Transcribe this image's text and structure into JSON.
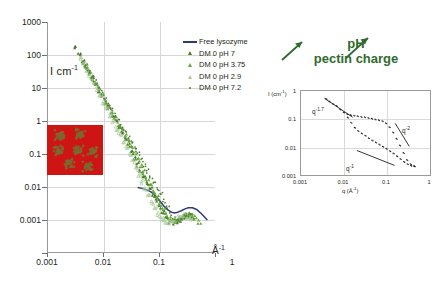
{
  "main": {
    "ylabel": "I cm",
    "ylabel_exp": "-1",
    "xlabel": "Å",
    "xlabel_exp": "-1",
    "yticks": [
      "1000",
      "100",
      "10",
      "1",
      "0.1",
      "0.01",
      "0.001"
    ],
    "xticks": [
      "0.001",
      "0.01",
      "0.1",
      "1"
    ]
  },
  "legend": {
    "items": [
      {
        "label": "Free lysozyme",
        "key": "line",
        "color": "#2b3b7a"
      },
      {
        "label": "DM 0  pH 7",
        "key": "triangle-dark",
        "color": "#4a7a2b"
      },
      {
        "label": "DM 0  pH 3.75",
        "key": "triangle-mid",
        "color": "#63a83a"
      },
      {
        "label": "DM 0  pH 2.9",
        "key": "triangle-open",
        "color": "#a9c89a"
      },
      {
        "label": "DM 0  pH 7.2",
        "key": "dot",
        "color": "#4d7d32"
      }
    ]
  },
  "annotation": {
    "line1": "pH",
    "line2": "pectin charge",
    "color": "#2f6b2f",
    "arrow_left": "arrow-up-right",
    "arrow_right": "arrow-up-right"
  },
  "tem_inset": {
    "background_color": "#cf1414",
    "particle_color": "#7a6a2e",
    "particle_count": 7
  },
  "inset": {
    "ylabel": "I (cm",
    "ylabel_exp": "-1",
    "ylabel_tail": ")",
    "xlabel": "q (Å",
    "xlabel_exp": "-1",
    "xlabel_tail": ")",
    "yticks": [
      "1",
      "0.1",
      "0.01",
      "0.001"
    ],
    "xticks": [
      "0.001",
      "0.01",
      "0.1",
      "1"
    ],
    "power_labels": [
      {
        "base": "q",
        "exp": "-1",
        "text": "q-1"
      },
      {
        "base": "q",
        "exp": "-2",
        "text": "q-2"
      },
      {
        "base": "q",
        "exp": "-1.7",
        "text": "q-1.7"
      }
    ]
  },
  "chart_data": {
    "type": "scatter",
    "title": "",
    "xlabel": "Å^-1",
    "ylabel": "I cm^-1",
    "xscale": "log",
    "yscale": "log",
    "xlim": [
      0.001,
      1
    ],
    "ylim": [
      0.001,
      1000
    ],
    "grid": true,
    "legend_position": "upper-right-inside",
    "series": [
      {
        "name": "Free lysozyme",
        "type": "line",
        "color": "#2b3b7a",
        "x": [
          0.04,
          0.05,
          0.06,
          0.07,
          0.08,
          0.09,
          0.1,
          0.12,
          0.14,
          0.16,
          0.18,
          0.2,
          0.24,
          0.28,
          0.32,
          0.38,
          0.45,
          0.55,
          0.7
        ],
        "y": [
          0.05,
          0.047,
          0.043,
          0.038,
          0.032,
          0.027,
          0.022,
          0.016,
          0.013,
          0.0115,
          0.011,
          0.0112,
          0.0125,
          0.014,
          0.015,
          0.015,
          0.0135,
          0.0105,
          0.0072
        ]
      },
      {
        "name": "DM 0  pH 7",
        "type": "scatter",
        "marker": "triangle",
        "color": "#4a7a2b",
        "x": [
          0.003,
          0.0036,
          0.0042,
          0.0048,
          0.0055,
          0.0063,
          0.0072,
          0.0082,
          0.0094,
          0.0107,
          0.0122,
          0.014,
          0.016,
          0.0182,
          0.0208,
          0.0237,
          0.0271,
          0.0309,
          0.0352,
          0.0402,
          0.0458,
          0.0523,
          0.0596,
          0.068,
          0.0776,
          0.0885,
          0.1009,
          0.1151,
          0.1313,
          0.1497,
          0.1707,
          0.1947,
          0.2221,
          0.2533,
          0.2889,
          0.3295,
          0.3758
        ],
        "y": [
          230.0,
          150.0,
          100.0,
          72.0,
          50.0,
          35.0,
          25.0,
          17.0,
          12.0,
          8.3,
          5.8,
          4.0,
          2.8,
          1.9,
          1.3,
          0.9,
          0.62,
          0.42,
          0.29,
          0.2,
          0.14,
          0.098,
          0.068,
          0.047,
          0.033,
          0.023,
          0.016,
          0.0115,
          0.0085,
          0.0068,
          0.0062,
          0.0064,
          0.0072,
          0.0082,
          0.009,
          0.0092,
          0.0088
        ]
      },
      {
        "name": "DM 0  pH 3.75",
        "type": "scatter",
        "marker": "triangle",
        "color": "#63a83a",
        "x": [
          0.0042,
          0.0048,
          0.0055,
          0.0063,
          0.0072,
          0.0082,
          0.0094,
          0.0107,
          0.0122,
          0.014,
          0.016,
          0.0182,
          0.0208,
          0.0237,
          0.0271,
          0.0309,
          0.0352,
          0.0402,
          0.0458,
          0.0523,
          0.0596,
          0.068,
          0.0776,
          0.0885,
          0.1009,
          0.1151,
          0.1313,
          0.1497,
          0.1707,
          0.1947,
          0.2221,
          0.2533,
          0.2889,
          0.3295,
          0.3758,
          0.43,
          0.5
        ],
        "y": [
          90.0,
          66.0,
          48.0,
          35.0,
          25.0,
          18.0,
          13.0,
          9.2,
          6.6,
          4.7,
          3.3,
          2.3,
          1.65,
          1.15,
          0.8,
          0.56,
          0.39,
          0.27,
          0.185,
          0.128,
          0.088,
          0.06,
          0.041,
          0.028,
          0.019,
          0.0135,
          0.01,
          0.008,
          0.007,
          0.007,
          0.0078,
          0.0088,
          0.0095,
          0.0098,
          0.0094,
          0.0082,
          0.0064
        ]
      },
      {
        "name": "DM 0  pH 2.9",
        "type": "scatter",
        "marker": "triangle-open",
        "color": "#a9c89a",
        "x": [
          0.0038,
          0.0044,
          0.005,
          0.0058,
          0.0066,
          0.0076,
          0.0087,
          0.0099,
          0.0113,
          0.013,
          0.0148,
          0.0169,
          0.0193,
          0.0221,
          0.0252,
          0.0288,
          0.0329,
          0.0375,
          0.0428,
          0.0489,
          0.0558,
          0.0637,
          0.0727,
          0.083,
          0.0948,
          0.1082,
          0.1235,
          0.141,
          0.161,
          0.1838,
          0.2098,
          0.2395,
          0.2734,
          0.3121,
          0.3563
        ],
        "y": [
          120.0,
          82.0,
          57.0,
          39.0,
          27.0,
          18.5,
          12.5,
          8.5,
          5.8,
          3.9,
          2.6,
          1.75,
          1.18,
          0.79,
          0.53,
          0.355,
          0.238,
          0.159,
          0.107,
          0.071,
          0.048,
          0.032,
          0.0215,
          0.0145,
          0.0102,
          0.0078,
          0.0066,
          0.0062,
          0.0066,
          0.0074,
          0.0082,
          0.0088,
          0.009,
          0.0086,
          0.0078
        ]
      },
      {
        "name": "DM 0  pH 7.2",
        "type": "scatter",
        "marker": "dot",
        "color": "#4d7d32",
        "x": [
          0.0046,
          0.0053,
          0.0061,
          0.007,
          0.008,
          0.0092,
          0.0105,
          0.012,
          0.0138,
          0.0158,
          0.0181,
          0.0207,
          0.0237,
          0.0271,
          0.031,
          0.0355,
          0.0406,
          0.0465,
          0.0532,
          0.0609,
          0.0697,
          0.0798,
          0.0913,
          0.1045,
          0.1196,
          0.1369,
          0.1567,
          0.1794,
          0.2053,
          0.235,
          0.269,
          0.3079,
          0.3525
        ],
        "y": [
          75.0,
          54.0,
          39.0,
          28.0,
          20.0,
          14.5,
          10.4,
          7.5,
          5.4,
          3.9,
          2.8,
          2.0,
          1.43,
          1.02,
          0.73,
          0.52,
          0.37,
          0.265,
          0.189,
          0.135,
          0.096,
          0.068,
          0.048,
          0.034,
          0.023,
          0.0152,
          0.0105,
          0.008,
          0.0072,
          0.0076,
          0.0086,
          0.0094,
          0.0092
        ]
      }
    ],
    "inset_chart": {
      "type": "scatter",
      "xlabel": "q (Å^-1)",
      "ylabel": "I (cm^-1)",
      "xscale": "log",
      "yscale": "log",
      "xlim": [
        0.001,
        1
      ],
      "ylim": [
        0.001,
        1
      ],
      "grid": true,
      "color": "#231f20",
      "annotations": [
        "q^-1.7",
        "q^-2",
        "q^-1"
      ],
      "series": [
        {
          "name": "upper branch",
          "x": [
            0.0038,
            0.0045,
            0.0055,
            0.0066,
            0.008,
            0.0097,
            0.0117,
            0.0141,
            0.017,
            0.0205,
            0.0248,
            0.03,
            0.0362,
            0.0437,
            0.0528,
            0.0637,
            0.077,
            0.093,
            0.1123,
            0.1356,
            0.1638,
            0.1978,
            0.2389,
            0.2885,
            0.3484,
            0.4208
          ],
          "y": [
            0.53,
            0.43,
            0.35,
            0.3,
            0.225,
            0.175,
            0.152,
            0.142,
            0.135,
            0.128,
            0.122,
            0.118,
            0.112,
            0.105,
            0.098,
            0.092,
            0.086,
            0.072,
            0.052,
            0.034,
            0.02,
            0.0115,
            0.0062,
            0.0035,
            0.0025,
            0.0021
          ]
        },
        {
          "name": "lower branch",
          "x": [
            0.012,
            0.0145,
            0.0175,
            0.0211,
            0.0255,
            0.0308,
            0.0372,
            0.0449,
            0.0542,
            0.0654,
            0.079,
            0.0954,
            0.1152,
            0.1391,
            0.1679,
            0.2028,
            0.2448,
            0.2956,
            0.3569,
            0.4309
          ],
          "y": [
            0.115,
            0.075,
            0.05,
            0.038,
            0.031,
            0.026,
            0.021,
            0.0175,
            0.0148,
            0.0125,
            0.0105,
            0.0088,
            0.0073,
            0.006,
            0.0048,
            0.0038,
            0.003,
            0.0025,
            0.0022,
            0.0021
          ]
        }
      ]
    }
  }
}
